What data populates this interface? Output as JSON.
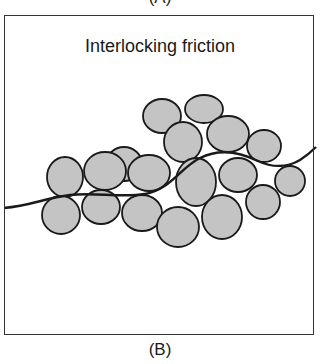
{
  "top_label": "(A)",
  "panel": {
    "title": "Interlocking friction"
  },
  "caption": "(B)",
  "colors": {
    "particle_fill": "#c4c4c4",
    "outline": "#1a1a1a",
    "background": "#ffffff"
  },
  "particles": [
    {
      "cx": 162,
      "cy": 116,
      "rx": 19,
      "ry": 17
    },
    {
      "cx": 204,
      "cy": 109,
      "rx": 19,
      "ry": 14
    },
    {
      "cx": 228,
      "cy": 134,
      "rx": 21,
      "ry": 18
    },
    {
      "cx": 124,
      "cy": 164,
      "rx": 18,
      "ry": 17
    },
    {
      "cx": 183,
      "cy": 142,
      "rx": 19,
      "ry": 20
    },
    {
      "cx": 264,
      "cy": 146,
      "rx": 17,
      "ry": 16
    },
    {
      "cx": 65,
      "cy": 177,
      "rx": 18,
      "ry": 20
    },
    {
      "cx": 105,
      "cy": 171,
      "rx": 21,
      "ry": 19
    },
    {
      "cx": 149,
      "cy": 173,
      "rx": 21,
      "ry": 18
    },
    {
      "cx": 196,
      "cy": 182,
      "rx": 20,
      "ry": 24
    },
    {
      "cx": 238,
      "cy": 175,
      "rx": 19,
      "ry": 17
    },
    {
      "cx": 290,
      "cy": 181,
      "rx": 15,
      "ry": 15
    },
    {
      "cx": 61,
      "cy": 215,
      "rx": 19,
      "ry": 19
    },
    {
      "cx": 101,
      "cy": 207,
      "rx": 19,
      "ry": 17
    },
    {
      "cx": 142,
      "cy": 213,
      "rx": 20,
      "ry": 18
    },
    {
      "cx": 178,
      "cy": 227,
      "rx": 21,
      "ry": 20
    },
    {
      "cx": 222,
      "cy": 217,
      "rx": 20,
      "ry": 22
    },
    {
      "cx": 263,
      "cy": 202,
      "rx": 17,
      "ry": 17
    }
  ]
}
